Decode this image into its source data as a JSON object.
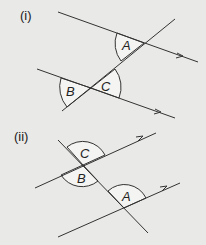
{
  "parts": [
    {
      "label": "(i)",
      "angles": [
        "A",
        "B",
        "C"
      ]
    },
    {
      "label": "(ii)",
      "angles": [
        "C",
        "B",
        "A"
      ]
    }
  ],
  "colors": {
    "background": "#e9e9e7",
    "line": "#333333"
  }
}
